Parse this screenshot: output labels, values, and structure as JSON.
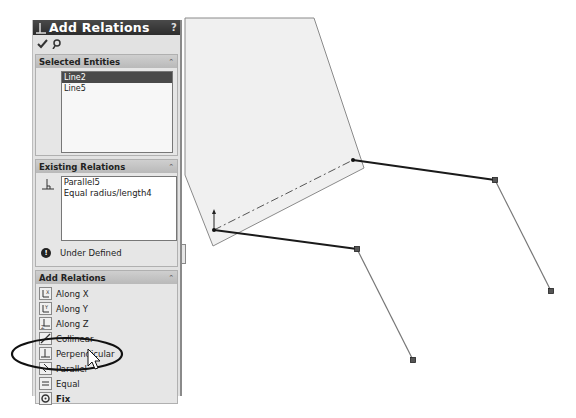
{
  "property_manager": {
    "title": "Add Relations",
    "help_label": "?",
    "ok_icon": "checkmark-icon",
    "pin_icon": "pushpin-icon",
    "selected_entities": {
      "header": "Selected Entities",
      "items": [
        {
          "label": "Line2",
          "selected": true
        },
        {
          "label": "Line5",
          "selected": false
        }
      ]
    },
    "existing_relations": {
      "header": "Existing Relations",
      "items": [
        "Parallel5",
        "Equal radius/length4"
      ],
      "status": "Under Defined"
    },
    "add_relations": {
      "header": "Add Relations",
      "items": [
        {
          "label": "Along X",
          "icon": "along-x-icon"
        },
        {
          "label": "Along Y",
          "icon": "along-y-icon"
        },
        {
          "label": "Along Z",
          "icon": "along-z-icon"
        },
        {
          "label": "Collinear",
          "icon": "collinear-icon"
        },
        {
          "label": "Perpendicular",
          "icon": "perpendicular-icon"
        },
        {
          "label": "Parallel",
          "icon": "parallel-icon"
        },
        {
          "label": "Equal",
          "icon": "equal-icon"
        },
        {
          "label": "Fix",
          "icon": "fix-icon"
        }
      ],
      "highlighted": "Parallel"
    }
  },
  "colors": {
    "panel_bg": "#e2e2e2",
    "title_bg": "#2c2c2c",
    "selection": "#4a4a4a",
    "plane_fill": "#f0f0f0",
    "sketch_line": "#1a1a1a"
  }
}
